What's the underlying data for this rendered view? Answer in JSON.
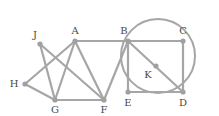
{
  "diagram": {
    "type": "graph",
    "stroke_color": "#a6a6a6",
    "node_color": "#a0a0a0",
    "label_color": "#4a4a4a",
    "nodes": [
      {
        "id": "A",
        "x": 75,
        "y": 41,
        "lx": 75,
        "ly": 31
      },
      {
        "id": "B",
        "x": 128,
        "y": 41,
        "lx": 124,
        "ly": 31
      },
      {
        "id": "C",
        "x": 183,
        "y": 41,
        "lx": 183,
        "ly": 31
      },
      {
        "id": "D",
        "x": 183,
        "y": 92,
        "lx": 183,
        "ly": 103
      },
      {
        "id": "E",
        "x": 128,
        "y": 92,
        "lx": 128,
        "ly": 103
      },
      {
        "id": "F",
        "x": 104,
        "y": 100,
        "lx": 104,
        "ly": 110
      },
      {
        "id": "G",
        "x": 55,
        "y": 100,
        "lx": 55,
        "ly": 110
      },
      {
        "id": "H",
        "x": 25,
        "y": 84,
        "lx": 14,
        "ly": 84
      },
      {
        "id": "J",
        "x": 40,
        "y": 44,
        "lx": 35,
        "ly": 35
      },
      {
        "id": "K",
        "x": 156,
        "y": 66,
        "lx": 148,
        "ly": 75
      }
    ],
    "edges": [
      [
        "H",
        "A"
      ],
      [
        "H",
        "G"
      ],
      [
        "J",
        "G"
      ],
      [
        "J",
        "F"
      ],
      [
        "A",
        "G"
      ],
      [
        "A",
        "F"
      ],
      [
        "A",
        "B"
      ],
      [
        "G",
        "F"
      ],
      [
        "F",
        "B"
      ],
      [
        "B",
        "C"
      ],
      [
        "C",
        "D"
      ],
      [
        "B",
        "E"
      ],
      [
        "E",
        "D"
      ],
      [
        "B",
        "D"
      ]
    ],
    "circle": {
      "cx": 158,
      "cy": 56,
      "r": 37
    }
  }
}
